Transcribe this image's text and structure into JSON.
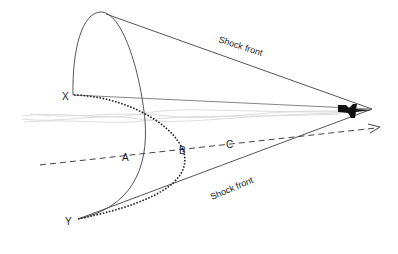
{
  "diagram": {
    "type": "shock-cone",
    "labels": {
      "upper_shock_front": "Shock front",
      "lower_shock_front": "Shock front",
      "point_x": "X",
      "point_y": "Y",
      "point_a": "A",
      "point_b": "B",
      "point_c": "C"
    },
    "colors": {
      "line": "#555555",
      "dotted": "#222222",
      "dashed": "#444444",
      "plane": "#111111",
      "contrail": "#cccccc"
    }
  }
}
